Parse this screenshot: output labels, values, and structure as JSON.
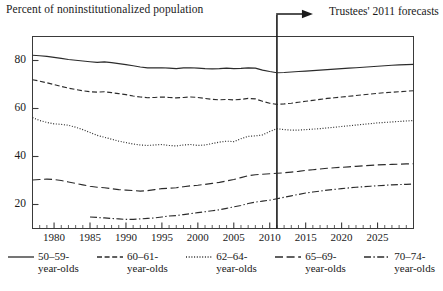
{
  "header": {
    "axis_title": "Percent of noninstitutionalized population",
    "annotation": "Trustees' 2011 forecasts"
  },
  "colors": {
    "ink": "#1a1a1a",
    "frame": "#3a3a3a",
    "series": "#2b2b2b"
  },
  "chart_data": {
    "type": "line",
    "title": "Percent of noninstitutionalized population",
    "subtitle": "",
    "xlabel": "",
    "ylabel": "Percent of noninstitutionalized population",
    "xlim": [
      1977,
      2030
    ],
    "ylim": [
      10,
      90
    ],
    "grid": false,
    "legend_position": "bottom",
    "annotations": [
      {
        "text": "Trustees' 2011 forecasts",
        "x": 2011,
        "type": "vertical-divider-with-arrow"
      }
    ],
    "ytick_labels": [
      "20",
      "40",
      "60",
      "80"
    ],
    "ytick_values": [
      20,
      40,
      60,
      80
    ],
    "xtick_labels": [
      "1980",
      "1985",
      "1990",
      "1995",
      "2000",
      "2005",
      "2010",
      "2015",
      "2020",
      "2025"
    ],
    "xtick_values": [
      1980,
      1985,
      1990,
      1995,
      2000,
      2005,
      2010,
      2015,
      2020,
      2025
    ],
    "minor_tick_interval": 1,
    "forecast_start_year": 2011,
    "series": [
      {
        "name": "50–59-year-olds",
        "label_line1": "50–59-",
        "label_line2": "year-olds",
        "dash": "solid",
        "x": [
          1977,
          1978,
          1979,
          1980,
          1981,
          1982,
          1983,
          1984,
          1985,
          1986,
          1987,
          1988,
          1989,
          1990,
          1991,
          1992,
          1993,
          1994,
          1995,
          1996,
          1997,
          1998,
          1999,
          2000,
          2001,
          2002,
          2003,
          2004,
          2005,
          2006,
          2007,
          2008,
          2009,
          2010,
          2011,
          2012,
          2013,
          2014,
          2015,
          2016,
          2017,
          2018,
          2019,
          2020,
          2021,
          2022,
          2023,
          2024,
          2025,
          2026,
          2027,
          2028,
          2029,
          2030
        ],
        "values": [
          82.2,
          82.0,
          81.7,
          81.3,
          80.9,
          80.4,
          80.1,
          79.8,
          79.5,
          79.2,
          79.4,
          79.1,
          78.7,
          78.3,
          77.8,
          77.3,
          76.9,
          76.9,
          77.0,
          76.8,
          76.6,
          76.9,
          77.0,
          76.8,
          76.6,
          76.5,
          76.6,
          76.8,
          76.6,
          76.7,
          76.9,
          76.8,
          76.0,
          75.4,
          74.9,
          75.0,
          75.2,
          75.4,
          75.6,
          75.8,
          76.0,
          76.2,
          76.4,
          76.6,
          76.8,
          77.0,
          77.2,
          77.4,
          77.6,
          77.8,
          78.0,
          78.2,
          78.3,
          78.4
        ]
      },
      {
        "name": "60–61-year-olds",
        "label_line1": "60–61-",
        "label_line2": "year-olds",
        "dash": "dashed",
        "x": [
          1977,
          1978,
          1979,
          1980,
          1981,
          1982,
          1983,
          1984,
          1985,
          1986,
          1987,
          1988,
          1989,
          1990,
          1991,
          1992,
          1993,
          1994,
          1995,
          1996,
          1997,
          1998,
          1999,
          2000,
          2001,
          2002,
          2003,
          2004,
          2005,
          2006,
          2007,
          2008,
          2009,
          2010,
          2011,
          2012,
          2013,
          2014,
          2015,
          2016,
          2017,
          2018,
          2019,
          2020,
          2021,
          2022,
          2023,
          2024,
          2025,
          2026,
          2027,
          2028,
          2029,
          2030
        ],
        "values": [
          72.0,
          71.4,
          70.7,
          70.0,
          69.2,
          68.5,
          67.9,
          67.4,
          67.0,
          66.8,
          67.0,
          66.6,
          66.2,
          65.8,
          65.2,
          64.8,
          64.5,
          64.6,
          64.8,
          64.6,
          64.4,
          64.6,
          64.8,
          64.6,
          64.2,
          63.8,
          63.6,
          63.8,
          63.6,
          63.8,
          64.2,
          64.0,
          63.0,
          62.2,
          61.7,
          61.9,
          62.2,
          62.6,
          63.0,
          63.4,
          63.8,
          64.2,
          64.5,
          64.8,
          65.1,
          65.4,
          65.7,
          66.0,
          66.3,
          66.6,
          66.8,
          67.0,
          67.2,
          67.4
        ]
      },
      {
        "name": "62–64-year-olds",
        "label_line1": "62–64-",
        "label_line2": "year-olds",
        "dash": "dotted",
        "x": [
          1977,
          1978,
          1979,
          1980,
          1981,
          1982,
          1983,
          1984,
          1985,
          1986,
          1987,
          1988,
          1989,
          1990,
          1991,
          1992,
          1993,
          1994,
          1995,
          1996,
          1997,
          1998,
          1999,
          2000,
          2001,
          2002,
          2003,
          2004,
          2005,
          2006,
          2007,
          2008,
          2009,
          2010,
          2011,
          2012,
          2013,
          2014,
          2015,
          2016,
          2017,
          2018,
          2019,
          2020,
          2021,
          2022,
          2023,
          2024,
          2025,
          2026,
          2027,
          2028,
          2029,
          2030
        ],
        "values": [
          56.2,
          55.0,
          54.2,
          53.6,
          53.4,
          53.0,
          52.2,
          51.2,
          50.0,
          48.8,
          48.0,
          47.2,
          46.4,
          45.8,
          45.2,
          44.8,
          44.6,
          44.8,
          45.0,
          44.6,
          44.4,
          44.8,
          45.0,
          44.6,
          44.8,
          45.4,
          46.0,
          46.4,
          46.2,
          47.4,
          48.4,
          48.6,
          49.0,
          50.4,
          51.6,
          51.2,
          51.0,
          51.0,
          51.2,
          51.4,
          51.6,
          51.9,
          52.2,
          52.5,
          52.8,
          53.1,
          53.4,
          53.7,
          54.0,
          54.2,
          54.4,
          54.6,
          54.8,
          55.0
        ]
      },
      {
        "name": "65–69-year-olds",
        "label_line1": "65–69-",
        "label_line2": "year-olds",
        "dash": "longdash",
        "x": [
          1977,
          1978,
          1979,
          1980,
          1981,
          1982,
          1983,
          1984,
          1985,
          1986,
          1987,
          1988,
          1989,
          1990,
          1991,
          1992,
          1993,
          1994,
          1995,
          1996,
          1997,
          1998,
          1999,
          2000,
          2001,
          2002,
          2003,
          2004,
          2005,
          2006,
          2007,
          2008,
          2009,
          2010,
          2011,
          2012,
          2013,
          2014,
          2015,
          2016,
          2017,
          2018,
          2019,
          2020,
          2021,
          2022,
          2023,
          2024,
          2025,
          2026,
          2027,
          2028,
          2029,
          2030
        ],
        "values": [
          30.2,
          30.4,
          30.6,
          30.4,
          30.0,
          29.4,
          28.8,
          28.2,
          27.6,
          27.2,
          27.0,
          26.6,
          26.2,
          26.0,
          25.8,
          25.6,
          25.8,
          26.2,
          26.6,
          26.8,
          27.0,
          27.4,
          27.8,
          28.0,
          28.4,
          28.8,
          29.2,
          29.8,
          30.4,
          31.2,
          32.0,
          32.4,
          32.6,
          32.8,
          33.0,
          33.2,
          33.5,
          33.8,
          34.2,
          34.5,
          34.8,
          35.1,
          35.3,
          35.5,
          35.7,
          35.9,
          36.1,
          36.3,
          36.5,
          36.6,
          36.7,
          36.8,
          36.9,
          37.0
        ]
      },
      {
        "name": "70–74-year-olds",
        "label_line1": "70–74-",
        "label_line2": "year-olds",
        "dash": "dashdot",
        "x": [
          1985,
          1986,
          1987,
          1988,
          1989,
          1990,
          1991,
          1992,
          1993,
          1994,
          1995,
          1996,
          1997,
          1998,
          1999,
          2000,
          2001,
          2002,
          2003,
          2004,
          2005,
          2006,
          2007,
          2008,
          2009,
          2010,
          2011,
          2012,
          2013,
          2014,
          2015,
          2016,
          2017,
          2018,
          2019,
          2020,
          2021,
          2022,
          2023,
          2024,
          2025,
          2026,
          2027,
          2028,
          2029,
          2030
        ],
        "values": [
          14.8,
          14.6,
          14.4,
          14.2,
          14.0,
          13.8,
          13.8,
          14.0,
          14.2,
          14.4,
          14.8,
          15.2,
          15.4,
          15.8,
          16.2,
          16.6,
          17.0,
          17.4,
          17.8,
          18.4,
          19.0,
          19.6,
          20.4,
          21.0,
          21.4,
          21.8,
          22.4,
          23.0,
          23.6,
          24.2,
          24.8,
          25.2,
          25.6,
          26.0,
          26.3,
          26.6,
          26.9,
          27.2,
          27.4,
          27.6,
          27.8,
          28.0,
          28.2,
          28.3,
          28.4,
          28.5
        ]
      }
    ]
  }
}
